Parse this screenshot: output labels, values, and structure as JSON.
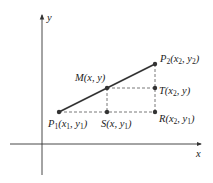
{
  "axes": {
    "x_label": "x",
    "y_label": "y"
  },
  "points": {
    "P1": {
      "name": "P",
      "sub": "1",
      "coords_text": "(x",
      "c1sub": "1",
      "mid": ", y",
      "c2sub": "1",
      "end": ")"
    },
    "P2": {
      "name": "P",
      "sub": "2",
      "coords_text": "(x",
      "c1sub": "2",
      "mid": ", y",
      "c2sub": "2",
      "end": ")"
    },
    "M": {
      "label": "M(x, y)"
    },
    "T": {
      "name": "T(x",
      "c1sub": "2",
      "end": ", y)"
    },
    "S": {
      "name": "S(x, y",
      "c2sub": "1",
      "end": ")"
    },
    "R": {
      "name": "R(x",
      "c1sub": "2",
      "mid": ", y",
      "c2sub": "1",
      "end": ")"
    }
  },
  "colors": {
    "line": "#333333",
    "dashed": "#555555",
    "point": "#333333"
  }
}
